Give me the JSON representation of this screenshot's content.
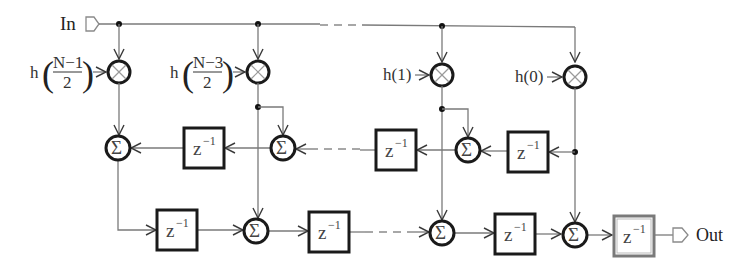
{
  "diagram": {
    "input_label": "In",
    "output_label": "Out",
    "coefficients": [
      {
        "id": "c1",
        "func": "h",
        "numerator": "N−1",
        "denominator": "2"
      },
      {
        "id": "c2",
        "func": "h",
        "numerator": "N−3",
        "denominator": "2"
      },
      {
        "id": "c3",
        "text": "h(1)"
      },
      {
        "id": "c4",
        "text": "h(0)"
      }
    ],
    "multiplier_symbol": "⊗",
    "adder_symbol": "Σ",
    "delay_base": "z",
    "delay_exp": "−1",
    "top_delays": 3,
    "bottom_delays": 3,
    "output_delays": 1
  }
}
